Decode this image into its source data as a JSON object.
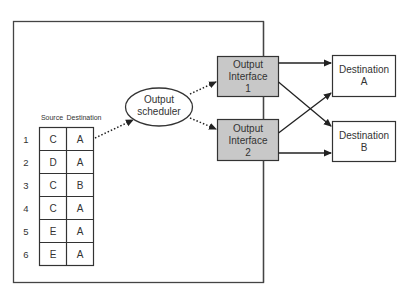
{
  "diagram": {
    "type": "router output scheduling",
    "colors": {
      "stroke": "#333333",
      "interface_fill": "#c8c8c8",
      "background": "#ffffff"
    },
    "scheduler": {
      "line1": "Output",
      "line2": "scheduler"
    },
    "queue_table": {
      "headers": {
        "source": "Source",
        "destination": "Destination"
      },
      "rows": [
        {
          "num": "1",
          "source": "C",
          "destination": "A"
        },
        {
          "num": "2",
          "source": "D",
          "destination": "A"
        },
        {
          "num": "3",
          "source": "C",
          "destination": "B"
        },
        {
          "num": "4",
          "source": "C",
          "destination": "A"
        },
        {
          "num": "5",
          "source": "E",
          "destination": "A"
        },
        {
          "num": "6",
          "source": "E",
          "destination": "A"
        }
      ]
    },
    "interfaces": [
      {
        "line1": "Output",
        "line2": "Interface",
        "line3": "1"
      },
      {
        "line1": "Output",
        "line2": "Interface",
        "line3": "2"
      }
    ],
    "destinations": [
      {
        "line1": "Destination",
        "line2": "A"
      },
      {
        "line1": "Destination",
        "line2": "B"
      }
    ],
    "edges": [
      {
        "from": "queue row 1",
        "to": "Output scheduler",
        "style": "dotted"
      },
      {
        "from": "Output scheduler",
        "to": "Output Interface 1",
        "style": "dotted"
      },
      {
        "from": "Output scheduler",
        "to": "Output Interface 2",
        "style": "dotted"
      },
      {
        "from": "Output Interface 1",
        "to": "Destination A",
        "style": "solid"
      },
      {
        "from": "Output Interface 1",
        "to": "Destination B",
        "style": "solid"
      },
      {
        "from": "Output Interface 2",
        "to": "Destination A",
        "style": "solid"
      },
      {
        "from": "Output Interface 2",
        "to": "Destination B",
        "style": "solid"
      }
    ]
  }
}
